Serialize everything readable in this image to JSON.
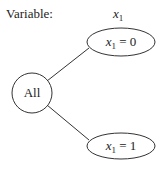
{
  "header": {
    "variable_label": "Variable:",
    "variable_name": "x",
    "variable_sub": "1"
  },
  "tree": {
    "root": {
      "label": "All"
    },
    "children": [
      {
        "var": "x",
        "sub": "1",
        "op": " = ",
        "value": "0"
      },
      {
        "var": "x",
        "sub": "1",
        "op": " = ",
        "value": "1"
      }
    ]
  },
  "colors": {
    "stroke": "#333333",
    "background": "#ffffff",
    "text": "#222222"
  }
}
